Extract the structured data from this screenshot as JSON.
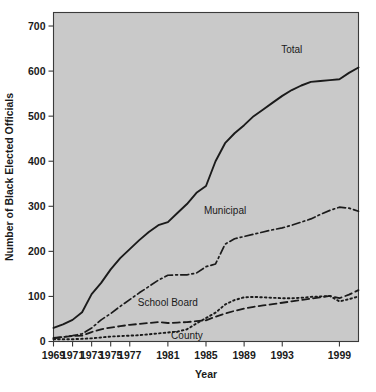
{
  "chart_data": {
    "type": "line",
    "title": "",
    "xlabel": "Year",
    "ylabel": "Number of Black Elected Officials",
    "xlim": [
      1969,
      2001
    ],
    "ylim": [
      0,
      730
    ],
    "grid": false,
    "legend": "inline-labels",
    "y_ticks": [
      0,
      100,
      200,
      300,
      400,
      500,
      600,
      700
    ],
    "x_ticks": [
      1969,
      1971,
      1973,
      1975,
      1977,
      1981,
      1985,
      1989,
      1993,
      1999
    ],
    "x_tick_labels": [
      "1969",
      "1971",
      "1973",
      "1975",
      "1977",
      "1981",
      "1985",
      "1989",
      "1993",
      "1999"
    ],
    "y_tick_labels": [
      "0",
      "100",
      "200",
      "300",
      "400",
      "500",
      "600",
      "700"
    ],
    "x": [
      1969,
      1970,
      1971,
      1972,
      1973,
      1974,
      1975,
      1976,
      1977,
      1978,
      1979,
      1980,
      1981,
      1982,
      1983,
      1984,
      1985,
      1986,
      1987,
      1988,
      1989,
      1990,
      1991,
      1992,
      1993,
      1994,
      1995,
      1996,
      1997,
      1998,
      1999,
      2000,
      2001
    ],
    "series": [
      {
        "name": "Total",
        "style": "solid",
        "label_x": 1994,
        "label_y": 640,
        "values": [
          30,
          38,
          48,
          65,
          105,
          130,
          160,
          185,
          205,
          225,
          243,
          258,
          265,
          285,
          305,
          330,
          345,
          400,
          440,
          462,
          480,
          500,
          515,
          530,
          545,
          558,
          568,
          576,
          578,
          580,
          582,
          596,
          608
        ]
      },
      {
        "name": "Municipal",
        "style": "dashdot",
        "label_x": 1987,
        "label_y": 283,
        "values": [
          8,
          10,
          13,
          17,
          30,
          48,
          62,
          78,
          93,
          108,
          122,
          136,
          147,
          148,
          148,
          152,
          166,
          172,
          216,
          228,
          233,
          238,
          243,
          248,
          252,
          258,
          265,
          272,
          282,
          291,
          298,
          296,
          289
        ]
      },
      {
        "name": "School Board",
        "style": "dashed",
        "label_x": 1981,
        "label_y": 78,
        "values": [
          7,
          10,
          12,
          13,
          21,
          27,
          31,
          34,
          37,
          39,
          41,
          43,
          41,
          42,
          43,
          45,
          47,
          55,
          62,
          68,
          73,
          77,
          80,
          83,
          86,
          89,
          92,
          95,
          98,
          101,
          96,
          104,
          114
        ]
      },
      {
        "name": "County",
        "style": "dotted",
        "label_x": 1983,
        "label_y": 6,
        "values": [
          5,
          5,
          5,
          6,
          7,
          9,
          11,
          12,
          13,
          14,
          16,
          18,
          20,
          22,
          27,
          40,
          52,
          64,
          82,
          92,
          98,
          99,
          98,
          97,
          96,
          96,
          97,
          99,
          100,
          101,
          89,
          94,
          100
        ]
      }
    ]
  },
  "axes": {
    "x_title": "Year",
    "y_title": "Number of Black Elected Officials"
  },
  "colors": {
    "plot_background": "#c9c9c9",
    "line": "#1b1b1b",
    "frame": "#3a3a3a",
    "page_background": "#ffffff"
  }
}
